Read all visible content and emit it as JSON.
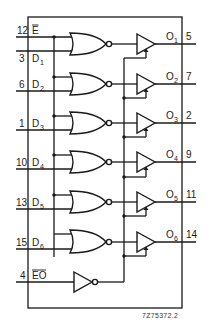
{
  "diagram": {
    "type": "logic-schematic",
    "reference_code": "7Z75372.2",
    "inputs": [
      {
        "pin": "12",
        "name": "E",
        "overbar": true
      },
      {
        "pin": "3",
        "name": "D",
        "sub": "1"
      },
      {
        "pin": "6",
        "name": "D",
        "sub": "2"
      },
      {
        "pin": "1",
        "name": "D",
        "sub": "3"
      },
      {
        "pin": "10",
        "name": "D",
        "sub": "4"
      },
      {
        "pin": "13",
        "name": "D",
        "sub": "5"
      },
      {
        "pin": "15",
        "name": "D",
        "sub": "6"
      },
      {
        "pin": "4",
        "name": "EO",
        "overbar": true
      }
    ],
    "outputs": [
      {
        "pin": "5",
        "name": "O",
        "sub": "1"
      },
      {
        "pin": "7",
        "name": "O",
        "sub": "2"
      },
      {
        "pin": "2",
        "name": "O",
        "sub": "3"
      },
      {
        "pin": "9",
        "name": "O",
        "sub": "4"
      },
      {
        "pin": "11",
        "name": "O",
        "sub": "5"
      },
      {
        "pin": "14",
        "name": "O",
        "sub": "6"
      }
    ],
    "gates": {
      "nor_count": 6,
      "inverter_count": 1,
      "tristate_buffer_count": 6
    }
  }
}
